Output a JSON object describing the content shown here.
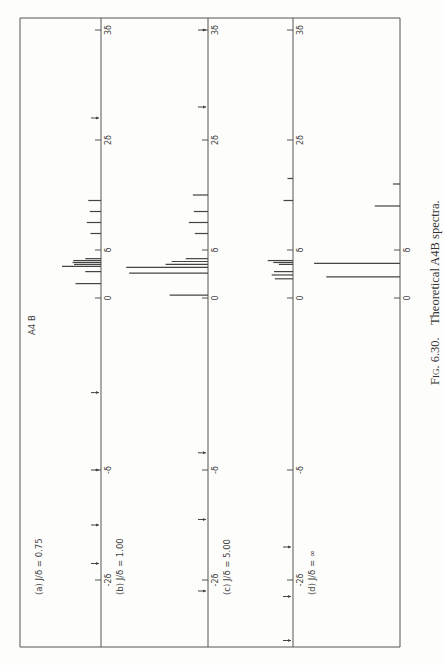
{
  "figure": {
    "caption_prefix": "Fig.",
    "caption_number": "6.30.",
    "caption_text": "Theoretical A4B spectra.",
    "system_label_main": "A",
    "system_label_sub": "4",
    "system_label_tail": "B"
  },
  "axis": {
    "tick_labels": [
      "-2δ",
      "-δ",
      "0",
      "δ",
      "2δ",
      "3δ"
    ],
    "tick_values": [
      -2,
      -1,
      0,
      1,
      2,
      3
    ]
  },
  "panels": [
    {
      "id": "a",
      "label": "(a)",
      "ratio_label": "J/δ",
      "eq": "=",
      "ratio_value": "0.75"
    },
    {
      "id": "b",
      "label": "(b)",
      "ratio_label": "J/δ",
      "eq": "=",
      "ratio_value": "1.00"
    },
    {
      "id": "c",
      "label": "(c)",
      "ratio_label": "J/δ",
      "eq": "=",
      "ratio_value": "5.00"
    },
    {
      "id": "d",
      "label": "(d)",
      "ratio_label": "J/δ",
      "eq": "=",
      "ratio_value": "∞"
    }
  ],
  "chart_data": {
    "type": "bar",
    "orientation": "rotated 90° counter-clockwise; frequency axis vertical, intensity horizontal",
    "xlabel": "frequency (units of δ)",
    "ylabel": "relative intensity",
    "xlim": [
      -2.2,
      3.2
    ],
    "x_ticks": [
      -2,
      -1,
      0,
      1,
      2,
      3
    ],
    "x_tick_labels": [
      "-2δ",
      "-δ",
      "0",
      "δ",
      "2δ",
      "3δ"
    ],
    "grid": false,
    "series": [
      {
        "name": "(a) J/δ = 0.75",
        "lines": [
          {
            "x": 1.45,
            "intensity": 0.17
          },
          {
            "x": 1.35,
            "intensity": 0.15
          },
          {
            "x": 1.25,
            "intensity": 0.19
          },
          {
            "x": 1.15,
            "intensity": 0.14
          },
          {
            "x": 0.82,
            "intensity": 0.21
          },
          {
            "x": 0.78,
            "intensity": 0.37
          },
          {
            "x": 0.74,
            "intensity": 0.38
          },
          {
            "x": 0.7,
            "intensity": 0.36
          },
          {
            "x": 0.66,
            "intensity": 0.52
          },
          {
            "x": 0.55,
            "intensity": 0.21
          },
          {
            "x": 0.3,
            "intensity": 0.34
          }
        ],
        "combination_markers": [
          2.2,
          -0.55,
          -1.0,
          -1.5,
          -1.85
        ]
      },
      {
        "name": "(b) J/δ = 1.00",
        "lines": [
          {
            "x": 1.5,
            "intensity": 0.15
          },
          {
            "x": 1.35,
            "intensity": 0.14
          },
          {
            "x": 1.25,
            "intensity": 0.19
          },
          {
            "x": 1.15,
            "intensity": 0.13
          },
          {
            "x": 0.82,
            "intensity": 0.22
          },
          {
            "x": 0.76,
            "intensity": 0.36
          },
          {
            "x": 0.7,
            "intensity": 0.42
          },
          {
            "x": 0.64,
            "intensity": 0.81
          },
          {
            "x": 0.52,
            "intensity": 0.78
          },
          {
            "x": 0.06,
            "intensity": 0.38
          }
        ],
        "combination_markers": [
          3.0,
          2.3,
          -0.9,
          -1.45,
          -2.1
        ]
      },
      {
        "name": "(c) J/δ = 5.00",
        "lines": [
          {
            "x": 1.65,
            "intensity": 0.07
          },
          {
            "x": 1.45,
            "intensity": 0.12
          },
          {
            "x": 0.78,
            "intensity": 0.32
          },
          {
            "x": 0.74,
            "intensity": 0.25
          },
          {
            "x": 0.7,
            "intensity": 0.18
          },
          {
            "x": 0.55,
            "intensity": 0.24
          },
          {
            "x": 0.48,
            "intensity": 0.27
          },
          {
            "x": 0.4,
            "intensity": 0.23
          }
        ],
        "combination_markers": [
          -1.7,
          -2.15,
          -2.55
        ]
      },
      {
        "name": "(d) J/δ = ∞",
        "lines": [
          {
            "x": 1.6,
            "intensity": 0.07
          },
          {
            "x": 1.4,
            "intensity": 0.25
          },
          {
            "x": 0.72,
            "intensity": 0.85
          },
          {
            "x": 0.44,
            "intensity": 0.73
          }
        ],
        "combination_markers": []
      }
    ]
  }
}
